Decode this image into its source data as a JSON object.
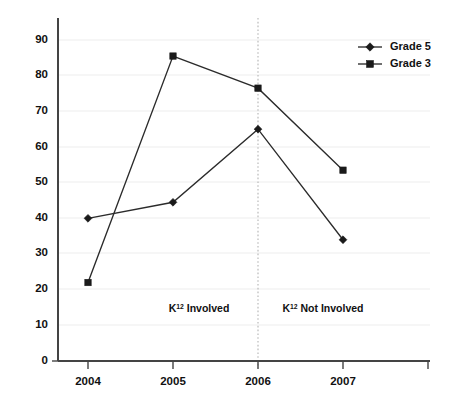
{
  "chart_data": {
    "type": "line",
    "title": "",
    "subtitle": "",
    "xlabel": "",
    "ylabel": "",
    "categories": [
      "2004",
      "2005",
      "2006",
      "2007"
    ],
    "ylim": [
      0,
      90
    ],
    "yticks": [
      0,
      10,
      20,
      30,
      40,
      50,
      60,
      70,
      80,
      90
    ],
    "grid": true,
    "legend_position": "top-right",
    "series": [
      {
        "name": "Grade 5",
        "marker": "diamond",
        "values": [
          40,
          44.5,
          65,
          34
        ]
      },
      {
        "name": "Grade 3",
        "marker": "square",
        "values": [
          22,
          85.5,
          76.5,
          53.5
        ]
      }
    ],
    "annotations": [
      {
        "base": "K",
        "sup": "12",
        "rest": " Involved",
        "x_category": "between-2004-2006"
      },
      {
        "base": "K",
        "sup": "12",
        "rest": " Not Involved",
        "x_category": "between-2006-2007"
      }
    ],
    "divider": {
      "at_category": "2006",
      "style": "dotted"
    },
    "colors": {
      "line": "#2b2b2b",
      "marker": "#1a1a1a",
      "grid": "#ededed",
      "axis": "#444444",
      "divider": "#b9b9b9",
      "background": "#ffffff"
    }
  },
  "axis": {
    "y_tick_labels": [
      "0",
      "10",
      "20",
      "30",
      "40",
      "50",
      "60",
      "70",
      "80",
      "90"
    ],
    "x_tick_labels": [
      "2004",
      "2005",
      "2006",
      "2007"
    ]
  },
  "legend": {
    "items": [
      {
        "label": "Grade 5"
      },
      {
        "label": "Grade 3"
      }
    ]
  },
  "annotations": {
    "left": {
      "base": "K",
      "sup": "12",
      "rest": " Involved"
    },
    "right": {
      "base": "K",
      "sup": "12",
      "rest": " Not Involved"
    }
  }
}
